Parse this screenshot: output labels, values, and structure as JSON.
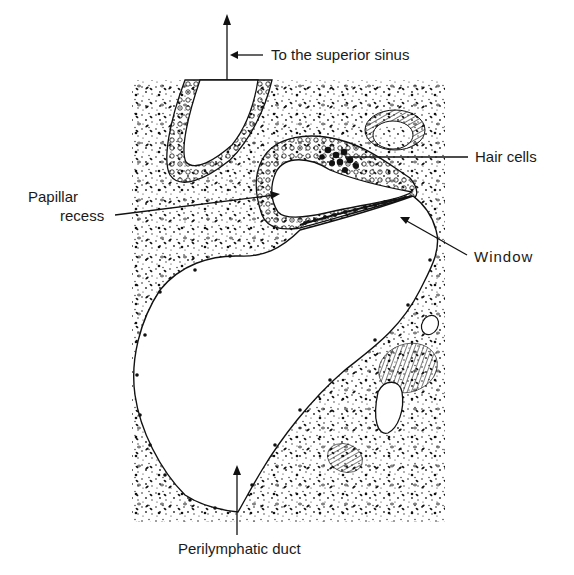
{
  "figure": {
    "type": "anatomical-illustration",
    "ink_color": "#1a1a1a",
    "background_color": "#ffffff"
  },
  "labels": {
    "superior_sinus": "To the superior sinus",
    "papillar_recess_line1": "Papillar",
    "papillar_recess_line2": "recess",
    "hair_cells": "Hair cells",
    "window": "Window",
    "perilymphatic_duct": "Perilymphatic duct"
  },
  "structures": [
    {
      "name": "superior-sinus-canal",
      "description": "U-shaped canal with epithelial wall at top"
    },
    {
      "name": "papillar-recess-chamber",
      "description": "cavity lined with cells, hair cells cluster at upper right"
    },
    {
      "name": "window-membrane",
      "description": "beaded membrane along lower edge of recess"
    },
    {
      "name": "perilymphatic-space",
      "description": "large cavity below"
    },
    {
      "name": "fibrous-bundles",
      "description": "hatched fiber bundles in connective tissue"
    },
    {
      "name": "stippled-tissue",
      "description": "dotted connective tissue background"
    }
  ]
}
